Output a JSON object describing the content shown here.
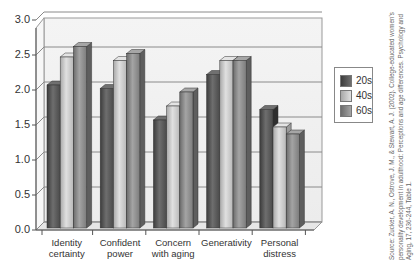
{
  "chart_data": {
    "type": "bar",
    "style": "3d-clustered",
    "title": "",
    "xlabel": "",
    "ylabel": "",
    "ylim": [
      0,
      3.0
    ],
    "yticks": [
      "0.0",
      "0.5",
      "1.0",
      "1.5",
      "2.0",
      "2.5",
      "3.0"
    ],
    "grid": true,
    "legend_position": "right",
    "categories": [
      "Identity certainty",
      "Confident power",
      "Concern with aging",
      "Generativity",
      "Personal distress"
    ],
    "category_lines": [
      [
        "Identity",
        "certainty"
      ],
      [
        "Confident",
        "power"
      ],
      [
        "Concern",
        "with aging"
      ],
      [
        "Generativity",
        ""
      ],
      [
        "Personal",
        "distress"
      ]
    ],
    "series": [
      {
        "name": "20s",
        "color": "#5a5a5a",
        "values": [
          2.1,
          2.05,
          1.6,
          2.25,
          1.75
        ]
      },
      {
        "name": "40s",
        "color": "#c8c8c8",
        "values": [
          2.5,
          2.45,
          1.8,
          2.45,
          1.5
        ]
      },
      {
        "name": "60s",
        "color": "#8e8e8e",
        "values": [
          2.65,
          2.55,
          2.0,
          2.45,
          1.4
        ]
      }
    ],
    "source": "Source: Zucker, A. N., Ostrove, J. M., & Stewart, A. J. (2002). College-educated women's personality development in adulthood: Perceptions and age differences. Psychology and Aging, 17, 236-244, Table 1."
  }
}
